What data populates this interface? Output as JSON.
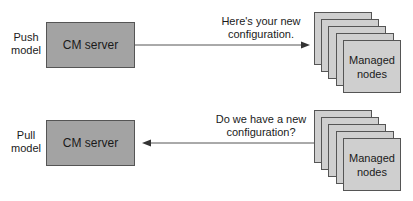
{
  "push": {
    "label_line1": "Push",
    "label_line2": "model",
    "server": "CM server",
    "message_line1": "Here's your new",
    "message_line2": "configuration.",
    "nodes": "Managed nodes",
    "nodes_line1": "Managed",
    "nodes_line2": "nodes",
    "arrow_direction": "server-to-nodes"
  },
  "pull": {
    "label_line1": "Pull",
    "label_line2": "model",
    "server": "CM server",
    "message_line1": "Do we have a new",
    "message_line2": "configuration?",
    "nodes": "Managed nodes",
    "nodes_line1": "Managed",
    "nodes_line2": "nodes",
    "arrow_direction": "nodes-to-server"
  },
  "colors": {
    "server_fill": "#a3a3a3",
    "node_fill": "#cfcfcf",
    "stroke": "#555555"
  }
}
